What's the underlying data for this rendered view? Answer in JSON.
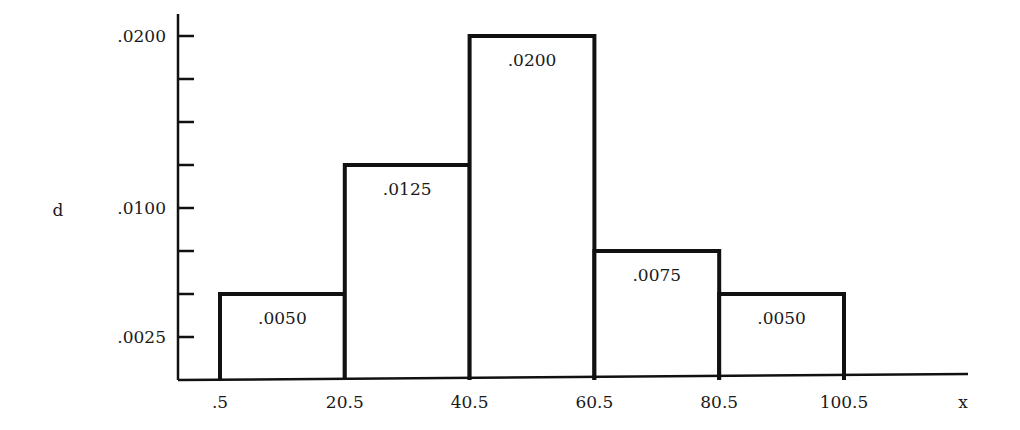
{
  "chart_data": {
    "type": "bar",
    "subtype": "histogram",
    "title": "",
    "xlabel": "x",
    "ylabel": "d",
    "bin_edges": [
      0.5,
      20.5,
      40.5,
      60.5,
      80.5,
      100.5
    ],
    "bin_edge_labels": [
      ".5",
      "20.5",
      "40.5",
      "60.5",
      "80.5",
      "100.5"
    ],
    "values": [
      0.005,
      0.0125,
      0.02,
      0.0075,
      0.005
    ],
    "value_labels": [
      ".0050",
      ".0125",
      ".0200",
      ".0075",
      ".0050"
    ],
    "y_ticks": [
      0.0025,
      0.005,
      0.0075,
      0.01,
      0.0125,
      0.015,
      0.0175,
      0.02
    ],
    "y_tick_labels": [
      {
        "value": 0.0025,
        "label": ".0025"
      },
      {
        "value": 0.01,
        "label": ".0100"
      },
      {
        "value": 0.02,
        "label": ".0200"
      }
    ],
    "xlim": [
      0.5,
      117
    ],
    "ylim": [
      0,
      0.0215
    ],
    "grid": false,
    "legend": "none"
  }
}
